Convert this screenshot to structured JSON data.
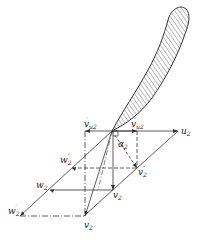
{
  "diagram": {
    "labels": {
      "u2": {
        "main": "u",
        "sub": "2"
      },
      "vu2_prime": {
        "main": "v",
        "sub": "u2",
        "sup": "′"
      },
      "vu2_dprime": {
        "main": "v",
        "sub": "u2",
        "sup": "″"
      },
      "alpha2": {
        "main": "α",
        "sub": "2"
      },
      "w2_dprime": {
        "main": "w",
        "sub": "2",
        "sup": "″"
      },
      "v2_dprime": {
        "main": "v",
        "sub": "2",
        "sup": "″"
      },
      "w2": {
        "main": "w",
        "sub": "2"
      },
      "v2": {
        "main": "v",
        "sub": "2"
      },
      "w2_prime": {
        "main": "w",
        "sub": "2",
        "sup": "′"
      },
      "v2_prime": {
        "main": "v",
        "sub": "2",
        "sup": "′"
      }
    },
    "colors": {
      "line": "#333333",
      "hatch": "#444444",
      "background": "#ffffff"
    }
  }
}
